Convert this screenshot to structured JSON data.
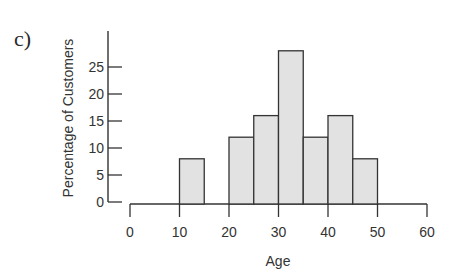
{
  "panel_label": "c)",
  "chart_data": {
    "type": "bar",
    "subtype": "histogram",
    "title": "",
    "xlabel": "Age",
    "ylabel": "Percentage of Customers",
    "xlim": [
      0,
      60
    ],
    "ylim": [
      0,
      30
    ],
    "x_ticks": [
      0,
      10,
      20,
      30,
      40,
      50,
      60
    ],
    "y_ticks": [
      0,
      5,
      10,
      15,
      20,
      25
    ],
    "bin_width": 5,
    "bins": [
      {
        "start": 10,
        "end": 15,
        "value": 8
      },
      {
        "start": 20,
        "end": 25,
        "value": 12
      },
      {
        "start": 25,
        "end": 30,
        "value": 16
      },
      {
        "start": 30,
        "end": 35,
        "value": 28
      },
      {
        "start": 35,
        "end": 40,
        "value": 12
      },
      {
        "start": 40,
        "end": 45,
        "value": 16
      },
      {
        "start": 45,
        "end": 50,
        "value": 8
      }
    ],
    "categories": [
      "10-15",
      "20-25",
      "25-30",
      "30-35",
      "35-40",
      "40-45",
      "45-50"
    ],
    "values": [
      8,
      12,
      16,
      28,
      12,
      16,
      8
    ],
    "grid": false,
    "legend": null,
    "colors": {
      "bar_fill": "#e2e2e2",
      "bar_stroke": "#333333",
      "axis": "#333333"
    }
  }
}
